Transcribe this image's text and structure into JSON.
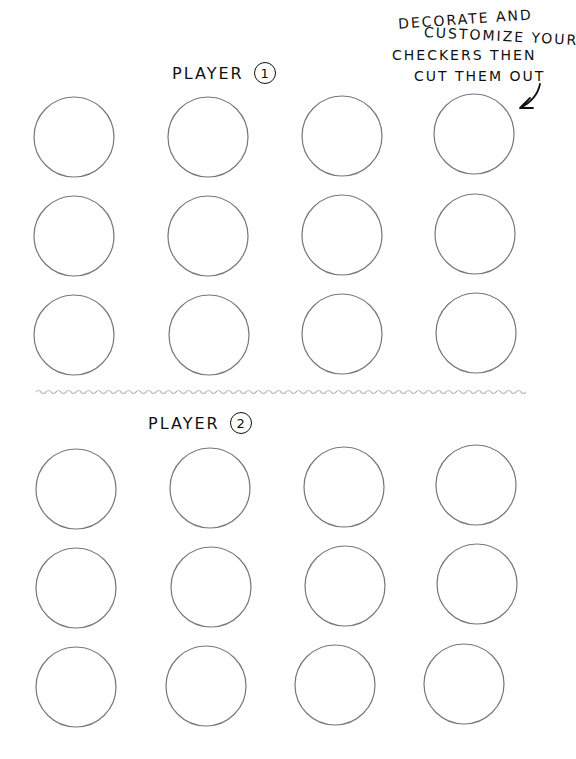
{
  "instructions": {
    "lines": [
      "DECORATE  AND",
      "CUSTOMIZE YOUR",
      "CHECKERS THEN",
      "CUT THEM  OUT"
    ]
  },
  "player1": {
    "label": "PLAYER",
    "number": "1",
    "checkers": [
      [
        74,
        137
      ],
      [
        208,
        137
      ],
      [
        342,
        136
      ],
      [
        474,
        134
      ],
      [
        74,
        236
      ],
      [
        208,
        236
      ],
      [
        342,
        235
      ],
      [
        475,
        234
      ],
      [
        74,
        335
      ],
      [
        209,
        335
      ],
      [
        342,
        334
      ],
      [
        476,
        333
      ]
    ]
  },
  "player2": {
    "label": "PLAYER",
    "number": "2",
    "checkers": [
      [
        76,
        489
      ],
      [
        210,
        488
      ],
      [
        344,
        487
      ],
      [
        476,
        485
      ],
      [
        76,
        588
      ],
      [
        211,
        587
      ],
      [
        345,
        586
      ],
      [
        477,
        584
      ],
      [
        76,
        687
      ],
      [
        206,
        686
      ],
      [
        335,
        685
      ],
      [
        464,
        684
      ]
    ]
  },
  "checker_radius": 40,
  "divider": {
    "style": "wavy",
    "color": "#bbbbbb"
  }
}
